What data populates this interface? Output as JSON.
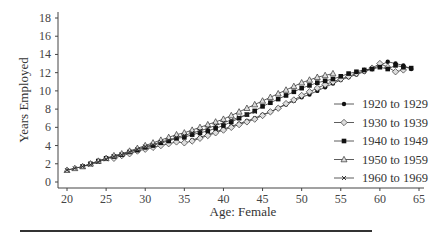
{
  "chart_data": {
    "type": "line",
    "title": "",
    "xlabel": "Age: Female",
    "ylabel": "Years Employed",
    "xlim": [
      20,
      65
    ],
    "ylim": [
      0,
      18
    ],
    "xticks": [
      20,
      25,
      30,
      35,
      40,
      45,
      50,
      55,
      60,
      65
    ],
    "yticks": [
      0,
      2,
      4,
      6,
      8,
      10,
      12,
      14,
      16,
      18
    ],
    "grid": false,
    "legend_position": "right-inside",
    "series": [
      {
        "name": "1920 to 1929",
        "marker": "filled-circle",
        "x": [
          36,
          37,
          38,
          39,
          40,
          41,
          42,
          43,
          44,
          45,
          46,
          47,
          48,
          49,
          50,
          51,
          52,
          53,
          54,
          55,
          56,
          57,
          58,
          59,
          60,
          61,
          62,
          63,
          64
        ],
        "values": [
          4.6,
          4.9,
          5.2,
          5.5,
          5.8,
          6.1,
          6.4,
          6.7,
          7.0,
          7.4,
          7.7,
          8.1,
          8.5,
          8.9,
          9.3,
          9.6,
          10.0,
          10.4,
          10.8,
          11.2,
          11.5,
          11.8,
          12.1,
          12.4,
          12.8,
          13.2,
          13.0,
          12.8,
          12.4
        ]
      },
      {
        "name": "1930 to 1939",
        "marker": "open-diamond",
        "x": [
          26,
          27,
          28,
          29,
          30,
          31,
          32,
          33,
          34,
          35,
          36,
          37,
          38,
          39,
          40,
          41,
          42,
          43,
          44,
          45,
          46,
          47,
          48,
          49,
          50,
          51,
          52,
          53,
          54,
          55,
          56,
          57,
          58,
          59,
          60,
          61,
          62,
          63
        ],
        "values": [
          2.6,
          2.9,
          3.1,
          3.4,
          3.6,
          3.8,
          4.0,
          4.2,
          4.4,
          4.3,
          4.5,
          4.8,
          5.1,
          5.4,
          5.7,
          6.0,
          6.3,
          6.6,
          6.9,
          7.3,
          7.7,
          8.1,
          8.6,
          9.0,
          9.5,
          9.9,
          10.3,
          10.7,
          11.0,
          11.3,
          11.6,
          11.9,
          12.2,
          12.5,
          13.0,
          12.6,
          12.1,
          12.3
        ]
      },
      {
        "name": "1940 to 1949",
        "marker": "filled-square",
        "x": [
          22,
          23,
          24,
          25,
          26,
          27,
          28,
          29,
          30,
          31,
          32,
          33,
          34,
          35,
          36,
          37,
          38,
          39,
          40,
          41,
          42,
          43,
          44,
          45,
          46,
          47,
          48,
          49,
          50,
          51,
          52,
          53,
          54,
          55,
          56,
          57,
          58,
          59,
          60,
          61,
          62,
          63,
          64
        ],
        "values": [
          1.7,
          2.0,
          2.3,
          2.6,
          2.8,
          3.0,
          3.3,
          3.5,
          3.8,
          4.0,
          4.3,
          4.5,
          4.8,
          4.9,
          5.2,
          5.4,
          5.6,
          5.9,
          6.2,
          6.6,
          7.0,
          7.4,
          7.8,
          8.3,
          8.7,
          9.1,
          9.5,
          9.9,
          10.3,
          10.6,
          10.9,
          11.1,
          11.3,
          11.6,
          11.9,
          12.1,
          12.3,
          12.4,
          12.6,
          12.4,
          12.8,
          12.6,
          12.5
        ]
      },
      {
        "name": "1950 to 1959",
        "marker": "open-triangle",
        "x": [
          20,
          21,
          22,
          23,
          24,
          25,
          26,
          27,
          28,
          29,
          30,
          31,
          32,
          33,
          34,
          35,
          36,
          37,
          38,
          39,
          40,
          41,
          42,
          43,
          44,
          45,
          46,
          47,
          48,
          49,
          50,
          51,
          52,
          53,
          54
        ],
        "values": [
          1.3,
          1.5,
          1.7,
          2.0,
          2.3,
          2.6,
          2.9,
          3.1,
          3.4,
          3.7,
          4.0,
          4.3,
          4.6,
          4.9,
          5.2,
          5.4,
          5.7,
          6.0,
          6.3,
          6.6,
          6.9,
          7.3,
          7.7,
          8.1,
          8.5,
          8.9,
          9.3,
          9.7,
          10.1,
          10.5,
          10.9,
          11.2,
          11.5,
          11.7,
          11.9
        ]
      },
      {
        "name": "1960 to 1969",
        "marker": "x",
        "x": [
          20,
          21,
          22,
          23,
          24,
          25,
          26,
          27,
          28,
          29,
          30,
          31,
          32,
          33,
          34,
          35,
          36,
          37,
          38,
          39,
          40,
          41,
          42,
          43,
          44
        ],
        "values": [
          1.3,
          1.5,
          1.7,
          1.9,
          2.2,
          2.5,
          2.8,
          3.0,
          3.3,
          3.6,
          3.9,
          4.1,
          4.4,
          4.6,
          4.9,
          5.1,
          5.4,
          5.6,
          5.9,
          6.2,
          6.5,
          6.8,
          7.1,
          7.4,
          7.7
        ]
      }
    ]
  }
}
